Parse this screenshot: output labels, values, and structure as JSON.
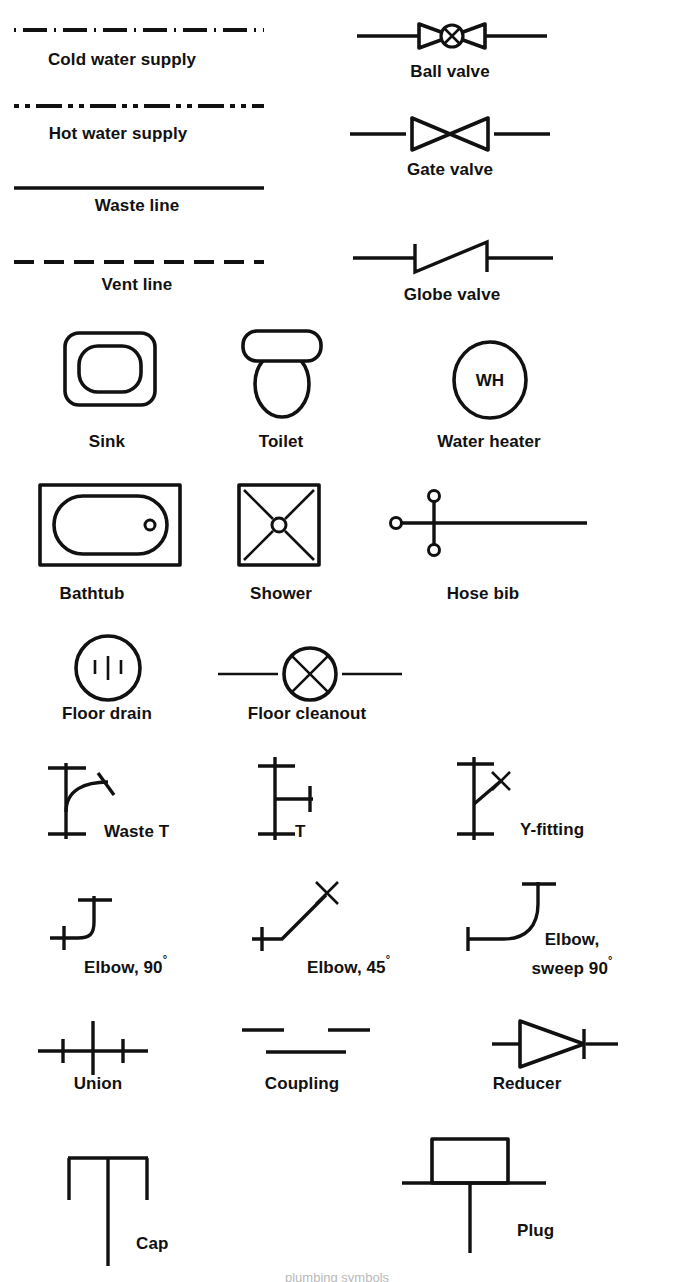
{
  "sheet": {
    "title": "Plumbing symbols reference chart",
    "background": "#ffffff",
    "ink": "#111111",
    "bottom_partial_caption": "plumbing symbols"
  },
  "symbols": [
    {
      "id": "cold-water-supply",
      "label": "Cold water supply",
      "type": "line",
      "line_style": "dash-dot",
      "label_x": 122,
      "label_y": 50,
      "sym_x": 14,
      "sym_y": 24
    },
    {
      "id": "hot-water-supply",
      "label": "Hot water supply",
      "type": "line",
      "line_style": "dash-dot-dot",
      "label_x": 118,
      "label_y": 124,
      "sym_x": 14,
      "sym_y": 100
    },
    {
      "id": "waste-line",
      "label": "Waste line",
      "type": "line",
      "line_style": "solid",
      "label_x": 137,
      "label_y": 196,
      "sym_x": 14,
      "sym_y": 183
    },
    {
      "id": "vent-line",
      "label": "Vent line",
      "type": "line",
      "line_style": "dashed",
      "label_x": 137,
      "label_y": 275,
      "sym_x": 14,
      "sym_y": 256
    },
    {
      "id": "ball-valve",
      "label": "Ball valve",
      "type": "valve",
      "label_x": 450,
      "label_y": 62,
      "sym_x": 357,
      "sym_y": 18
    },
    {
      "id": "gate-valve",
      "label": "Gate valve",
      "type": "valve",
      "label_x": 450,
      "label_y": 160,
      "sym_x": 350,
      "sym_y": 112
    },
    {
      "id": "globe-valve",
      "label": "Globe valve",
      "type": "valve",
      "label_x": 452,
      "label_y": 285,
      "sym_x": 353,
      "sym_y": 234
    },
    {
      "id": "sink",
      "label": "Sink",
      "type": "fixture",
      "label_x": 107,
      "label_y": 432,
      "sym_x": 62,
      "sym_y": 330
    },
    {
      "id": "toilet",
      "label": "Toilet",
      "type": "fixture",
      "label_x": 281,
      "label_y": 432,
      "sym_x": 235,
      "sym_y": 328
    },
    {
      "id": "water-heater",
      "label": "Water heater",
      "label_short": "WH",
      "type": "fixture",
      "label_x": 489,
      "label_y": 432,
      "sym_x": 450,
      "sym_y": 339
    },
    {
      "id": "bathtub",
      "label": "Bathtub",
      "type": "fixture",
      "label_x": 92,
      "label_y": 584,
      "sym_x": 37,
      "sym_y": 482
    },
    {
      "id": "shower",
      "label": "Shower",
      "type": "fixture",
      "label_x": 281,
      "label_y": 584,
      "sym_x": 236,
      "sym_y": 482
    },
    {
      "id": "hose-bib",
      "label": "Hose bib",
      "type": "fixture",
      "label_x": 483,
      "label_y": 584,
      "sym_x": 387,
      "sym_y": 488
    },
    {
      "id": "floor-drain",
      "label": "Floor drain",
      "type": "fixture",
      "label_x": 107,
      "label_y": 704,
      "sym_x": 73,
      "sym_y": 633
    },
    {
      "id": "floor-cleanout",
      "label": "Floor cleanout",
      "type": "fixture",
      "label_x": 307,
      "label_y": 704,
      "sym_x": 218,
      "sym_y": 645
    },
    {
      "id": "waste-t",
      "label": "Waste T",
      "type": "fitting",
      "label_x": 104,
      "label_y": 822,
      "sym_x": 40,
      "sym_y": 755
    },
    {
      "id": "t",
      "label": "T",
      "type": "fitting",
      "label_x": 295,
      "label_y": 822,
      "sym_x": 253,
      "sym_y": 752
    },
    {
      "id": "y-fitting",
      "label": "Y-fitting",
      "type": "fitting",
      "label_x": 520,
      "label_y": 820,
      "sym_x": 452,
      "sym_y": 752
    },
    {
      "id": "elbow-90",
      "label": "Elbow, 90",
      "label_suffix": "°",
      "type": "fitting",
      "label_x": 84,
      "label_y": 949,
      "sym_x": 42,
      "sym_y": 884
    },
    {
      "id": "elbow-45",
      "label": "Elbow, 45",
      "label_suffix": "°",
      "type": "fitting",
      "label_x": 307,
      "label_y": 949,
      "sym_x": 240,
      "sym_y": 876
    },
    {
      "id": "elbow-sweep-90",
      "label_line1": "Elbow,",
      "label_line2": "sweep 90",
      "label_suffix": "°",
      "type": "fitting",
      "label_x": 572,
      "label_y": 930,
      "sym_x": 460,
      "sym_y": 876
    },
    {
      "id": "union",
      "label": "Union",
      "type": "fitting",
      "label_x": 98,
      "label_y": 1074,
      "sym_x": 33,
      "sym_y": 1013
    },
    {
      "id": "coupling",
      "label": "Coupling",
      "type": "fitting",
      "label_x": 302,
      "label_y": 1074,
      "sym_x": 240,
      "sym_y": 1018
    },
    {
      "id": "reducer",
      "label": "Reducer",
      "type": "fitting",
      "label_x": 527,
      "label_y": 1074,
      "sym_x": 490,
      "sym_y": 1013
    },
    {
      "id": "cap",
      "label": "Cap",
      "type": "fitting",
      "label_x": 136,
      "label_y": 1259,
      "sym_x": 60,
      "sym_y": 1152
    },
    {
      "id": "plug",
      "label": "Plug",
      "type": "fitting",
      "label_x": 517,
      "label_y": 1250,
      "sym_x": 400,
      "sym_y": 1133
    }
  ]
}
